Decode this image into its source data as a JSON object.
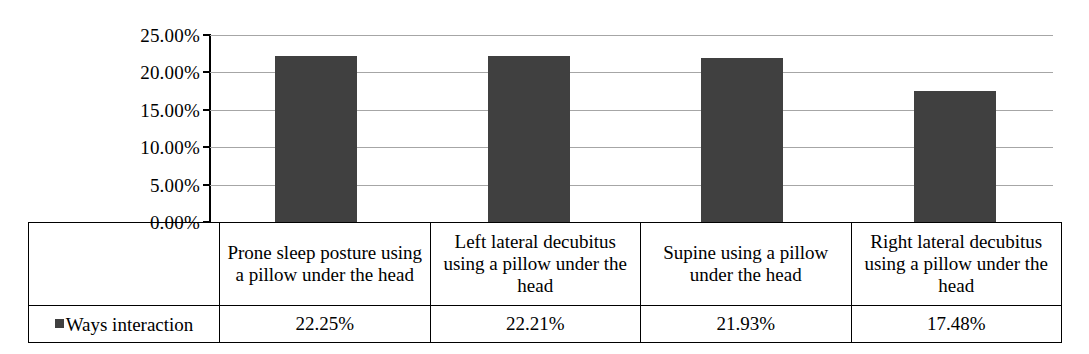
{
  "chart_data": {
    "type": "bar",
    "title": "",
    "xlabel": "",
    "ylabel": "",
    "categories": [
      "Prone sleep posture using a pillow under the head",
      "Left lateral decubitus using a pillow under the head",
      "Supine using a pillow under the head",
      "Right lateral decubitus using a pillow under the head"
    ],
    "series": [
      {
        "name": "Ways interaction",
        "values": [
          22.25,
          22.21,
          21.93,
          17.48
        ],
        "value_labels": [
          "22.25%",
          "22.21%",
          "21.93%",
          "17.48%"
        ],
        "color": "#404040"
      }
    ],
    "ylim": [
      0,
      25
    ],
    "ytick_labels": [
      "25.00%",
      "20.00%",
      "15.00%",
      "10.00%",
      "5.00%",
      "0.00%"
    ],
    "ytick_values": [
      25,
      20,
      15,
      10,
      5,
      0
    ],
    "grid": true,
    "grid_color": "#a6a6a6",
    "legend_position": "data-table-row",
    "has_data_table": true
  },
  "legend": {
    "marker_name": "series-color-swatch",
    "label": "Ways interaction"
  }
}
